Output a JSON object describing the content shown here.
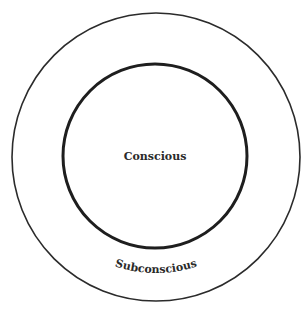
{
  "diagram": {
    "type": "concentric-circles",
    "outer_circle": {
      "label": "Subconscious",
      "cx": 156,
      "cy": 157,
      "r": 144,
      "stroke": "#2b2b2b",
      "stroke_width": 1.6
    },
    "inner_circle": {
      "label": "Conscious",
      "cx": 155,
      "cy": 156,
      "r": 92,
      "stroke": "#1e1e1e",
      "stroke_width": 3
    },
    "background": "#ffffff"
  }
}
